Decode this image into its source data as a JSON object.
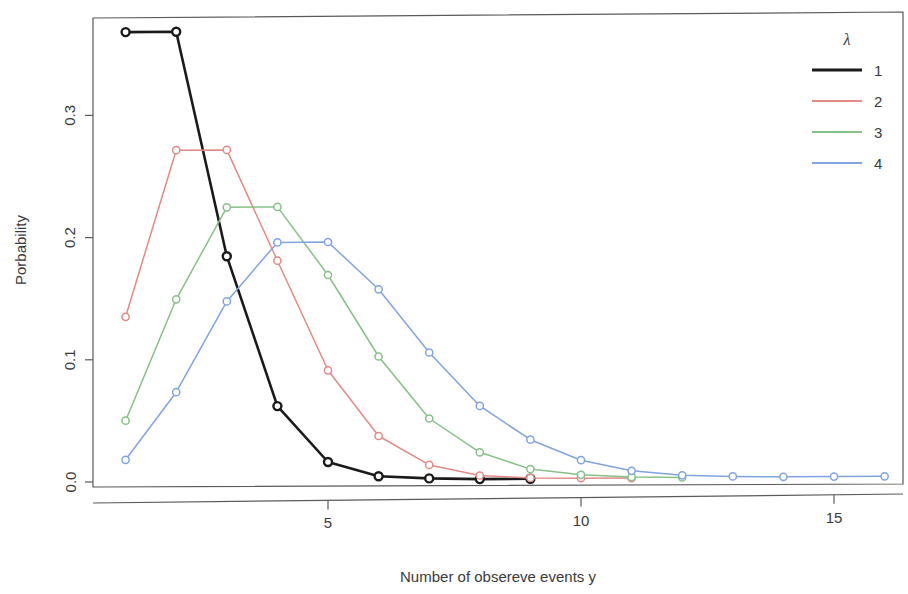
{
  "chart_data": {
    "type": "line",
    "title": "",
    "subtitle": "",
    "xlabel": "Number of obsereve events y",
    "ylabel": "Porbability",
    "xlim": [
      0.5,
      16.6
    ],
    "ylim": [
      -0.012,
      0.395
    ],
    "xticks": [
      5,
      10,
      15
    ],
    "xtick_labels": [
      "5",
      "10",
      "15"
    ],
    "yticks": [
      0.0,
      0.1,
      0.2,
      0.3
    ],
    "ytick_labels": [
      "0.0",
      "0.1",
      "0.2",
      "0.3"
    ],
    "grid": false,
    "marker": "open-circle",
    "legend": {
      "position": "top-right",
      "title": "λ",
      "entries": [
        {
          "label": "1",
          "color": "#1a1a1a"
        },
        {
          "label": "2",
          "color": "#e28b86"
        },
        {
          "label": "3",
          "color": "#86c186"
        },
        {
          "label": "4",
          "color": "#80a4e0"
        }
      ]
    },
    "series": [
      {
        "name": "1",
        "color": "#1a1a1a",
        "x": [
          1,
          2,
          3,
          4,
          5,
          6,
          7,
          8,
          9
        ],
        "values": [
          0.368,
          0.368,
          0.184,
          0.061,
          0.015,
          0.003,
          0.001,
          0.0001,
          1e-05
        ]
      },
      {
        "name": "2",
        "color": "#e28b86",
        "x": [
          1,
          2,
          3,
          4,
          5,
          6,
          7,
          8,
          9,
          10,
          11
        ],
        "values": [
          0.135,
          0.271,
          0.271,
          0.18,
          0.09,
          0.036,
          0.012,
          0.003,
          0.0008,
          0.0002,
          3e-05
        ]
      },
      {
        "name": "3",
        "color": "#86c186",
        "x": [
          1,
          2,
          3,
          4,
          5,
          6,
          7,
          8,
          9,
          10,
          11,
          12
        ],
        "values": [
          0.05,
          0.149,
          0.224,
          0.224,
          0.168,
          0.101,
          0.05,
          0.022,
          0.008,
          0.003,
          0.001,
          0.0002
        ]
      },
      {
        "name": "4",
        "color": "#80a4e0",
        "x": [
          1,
          2,
          3,
          4,
          5,
          6,
          7,
          8,
          9,
          10,
          11,
          12,
          13,
          14,
          15,
          16
        ],
        "values": [
          0.018,
          0.073,
          0.147,
          0.195,
          0.195,
          0.156,
          0.104,
          0.06,
          0.032,
          0.015,
          0.006,
          0.002,
          0.0008,
          0.0002,
          6e-05,
          2e-05
        ]
      }
    ]
  },
  "plot": {
    "box": {
      "left": 93,
      "top": 15,
      "right": 903,
      "bottom": 487
    },
    "x_axis_line_y": 501,
    "x_pixel_per_unit": 50.6,
    "x_origin_px": 75.0,
    "y_zero_px": 482,
    "y_pixel_per_unit": 1222.0
  }
}
